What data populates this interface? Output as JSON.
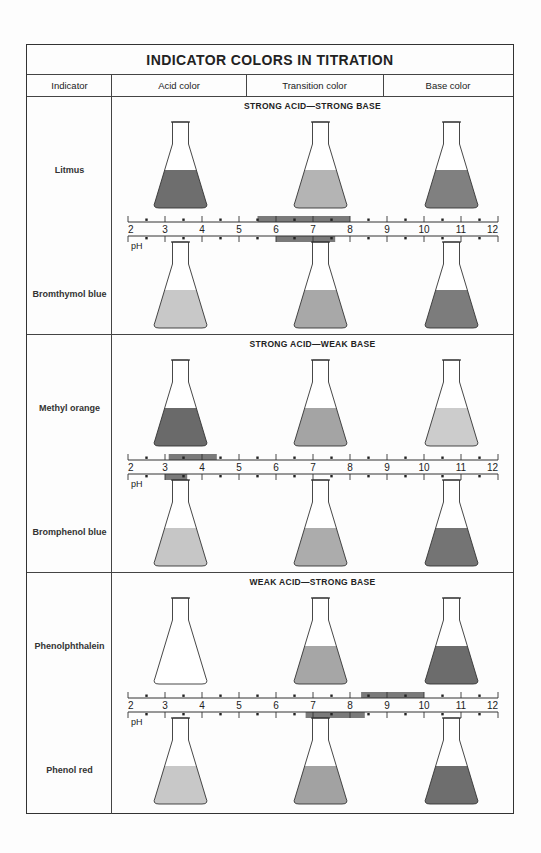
{
  "title": "INDICATOR COLORS IN TITRATION",
  "columns": [
    "Indicator",
    "Acid color",
    "Transition color",
    "Base color"
  ],
  "scale": {
    "min": 2,
    "max": 12,
    "label": "pH",
    "ticks": [
      2,
      3,
      4,
      5,
      6,
      7,
      8,
      9,
      10,
      11,
      12
    ]
  },
  "colors": {
    "border": "#333333",
    "range_bar": "#7a7a7a",
    "white": "#ffffff"
  },
  "sections": [
    {
      "title": "STRONG ACID—STRONG BASE",
      "indicators": [
        {
          "name": "Litmus",
          "range": [
            5.5,
            8.0
          ],
          "acid_color": "#6e6e6e",
          "transition_color": "#b4b4b4",
          "base_color": "#808080"
        },
        {
          "name": "Bromthymol blue",
          "range": [
            6.0,
            7.6
          ],
          "acid_color": "#c8c8c8",
          "transition_color": "#a8a8a8",
          "base_color": "#7c7c7c"
        }
      ]
    },
    {
      "title": "STRONG ACID—WEAK BASE",
      "indicators": [
        {
          "name": "Methyl orange",
          "range": [
            3.1,
            4.4
          ],
          "acid_color": "#6a6a6a",
          "transition_color": "#a4a4a4",
          "base_color": "#cccccc"
        },
        {
          "name": "Bromphenol blue",
          "range": [
            3.0,
            3.6
          ],
          "acid_color": "#c6c6c6",
          "transition_color": "#acacac",
          "base_color": "#747474"
        }
      ]
    },
    {
      "title": "WEAK ACID—STRONG BASE",
      "indicators": [
        {
          "name": "Phenolphthalein",
          "range": [
            8.3,
            10.0
          ],
          "acid_color": "#ffffff",
          "transition_color": "#a6a6a6",
          "base_color": "#6c6c6c"
        },
        {
          "name": "Phenol red",
          "range": [
            6.8,
            8.4
          ],
          "acid_color": "#c8c8c8",
          "transition_color": "#a2a2a2",
          "base_color": "#6e6e6e"
        }
      ]
    }
  ],
  "chart_data": {
    "type": "table",
    "title": "INDICATOR COLORS IN TITRATION",
    "xlabel": "pH",
    "xlim": [
      2,
      12
    ],
    "columns": [
      "Indicator",
      "Titration type",
      "Transition range low (pH)",
      "Transition range high (pH)"
    ],
    "rows": [
      [
        "Litmus",
        "Strong acid-strong base",
        5.5,
        8.0
      ],
      [
        "Bromthymol blue",
        "Strong acid-strong base",
        6.0,
        7.6
      ],
      [
        "Methyl orange",
        "Strong acid-weak base",
        3.1,
        4.4
      ],
      [
        "Bromphenol blue",
        "Strong acid-weak base",
        3.0,
        3.6
      ],
      [
        "Phenolphthalein",
        "Weak acid-strong base",
        8.3,
        10.0
      ],
      [
        "Phenol red",
        "Weak acid-strong base",
        6.8,
        8.4
      ]
    ]
  }
}
